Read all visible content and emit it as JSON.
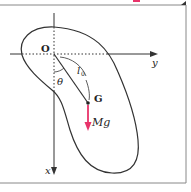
{
  "figure": {
    "origin_label": "O",
    "center_label": "G",
    "length_label_main": "l",
    "length_label_sub": "0",
    "angle_label": "θ",
    "force_label": "Mg",
    "x_axis_label": "x",
    "y_axis_label": "y"
  },
  "colors": {
    "line": "#333333",
    "force": "#e8336a",
    "frame": "#888888",
    "background": "#ffffff"
  }
}
